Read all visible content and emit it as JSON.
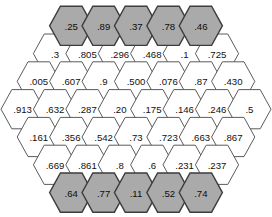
{
  "figure": {
    "name": "hexagon-grid",
    "background_color": "#ffffff",
    "shaded_fill": "#aaaaaa",
    "plain_fill": "#ffffff",
    "shaded_stroke": "#3d3d3d",
    "plain_stroke": "#5b5b5b"
  },
  "chart_data": {
    "type": "heatmap",
    "title": "",
    "xlabel": "",
    "ylabel": "",
    "layout": "hexagonal-honeycomb",
    "orientation": "flat-top",
    "grid": false,
    "legend": "none",
    "rows": [
      {
        "index": 0,
        "count": 5,
        "shaded": true,
        "cells": [
          {
            "label": ".25",
            "value": 0.25,
            "shaded": true
          },
          {
            "label": ".89",
            "value": 0.89,
            "shaded": true
          },
          {
            "label": ".37",
            "value": 0.37,
            "shaded": true
          },
          {
            "label": ".78",
            "value": 0.78,
            "shaded": true
          },
          {
            "label": ".46",
            "value": 0.46,
            "shaded": true
          }
        ]
      },
      {
        "index": 1,
        "count": 6,
        "shaded": false,
        "cells": [
          {
            "label": ".3",
            "value": 0.3,
            "shaded": false
          },
          {
            "label": ".805",
            "value": 0.805,
            "shaded": false
          },
          {
            "label": ".296",
            "value": 0.296,
            "shaded": false
          },
          {
            "label": ".468",
            "value": 0.468,
            "shaded": false
          },
          {
            "label": ".1",
            "value": 0.1,
            "shaded": false
          },
          {
            "label": ".725",
            "value": 0.725,
            "shaded": false
          }
        ]
      },
      {
        "index": 2,
        "count": 7,
        "shaded": false,
        "cells": [
          {
            "label": ".005",
            "value": 0.005,
            "shaded": false
          },
          {
            "label": ".607",
            "value": 0.607,
            "shaded": false
          },
          {
            "label": ".9",
            "value": 0.9,
            "shaded": false
          },
          {
            "label": ".500",
            "value": 0.5,
            "shaded": false
          },
          {
            "label": ".076",
            "value": 0.076,
            "shaded": false
          },
          {
            "label": ".87",
            "value": 0.87,
            "shaded": false
          },
          {
            "label": ".430",
            "value": 0.43,
            "shaded": false
          }
        ]
      },
      {
        "index": 3,
        "count": 8,
        "shaded": false,
        "cells": [
          {
            "label": ".913",
            "value": 0.913,
            "shaded": false
          },
          {
            "label": ".632",
            "value": 0.632,
            "shaded": false
          },
          {
            "label": ".287",
            "value": 0.287,
            "shaded": false
          },
          {
            "label": ".20",
            "value": 0.2,
            "shaded": false
          },
          {
            "label": ".175",
            "value": 0.175,
            "shaded": false
          },
          {
            "label": ".146",
            "value": 0.146,
            "shaded": false
          },
          {
            "label": ".246",
            "value": 0.246,
            "shaded": false
          },
          {
            "label": ".5",
            "value": 0.5,
            "shaded": false
          }
        ]
      },
      {
        "index": 4,
        "count": 7,
        "shaded": false,
        "cells": [
          {
            "label": ".161",
            "value": 0.161,
            "shaded": false
          },
          {
            "label": ".356",
            "value": 0.356,
            "shaded": false
          },
          {
            "label": ".542",
            "value": 0.542,
            "shaded": false
          },
          {
            "label": ".73",
            "value": 0.73,
            "shaded": false
          },
          {
            "label": ".723",
            "value": 0.723,
            "shaded": false
          },
          {
            "label": ".663",
            "value": 0.663,
            "shaded": false
          },
          {
            "label": ".867",
            "value": 0.867,
            "shaded": false
          }
        ]
      },
      {
        "index": 5,
        "count": 6,
        "shaded": false,
        "cells": [
          {
            "label": ".669",
            "value": 0.669,
            "shaded": false
          },
          {
            "label": ".861",
            "value": 0.861,
            "shaded": false
          },
          {
            "label": ".8",
            "value": 0.8,
            "shaded": false
          },
          {
            "label": ".6",
            "value": 0.6,
            "shaded": false
          },
          {
            "label": ".231",
            "value": 0.231,
            "shaded": false
          },
          {
            "label": ".237",
            "value": 0.237,
            "shaded": false
          }
        ]
      },
      {
        "index": 6,
        "count": 5,
        "shaded": true,
        "cells": [
          {
            "label": ".64",
            "value": 0.64,
            "shaded": true
          },
          {
            "label": ".77",
            "value": 0.77,
            "shaded": true
          },
          {
            "label": ".11",
            "value": 0.11,
            "shaded": true
          },
          {
            "label": ".52",
            "value": 0.52,
            "shaded": true
          },
          {
            "label": ".74",
            "value": 0.74,
            "shaded": true
          }
        ]
      }
    ]
  }
}
